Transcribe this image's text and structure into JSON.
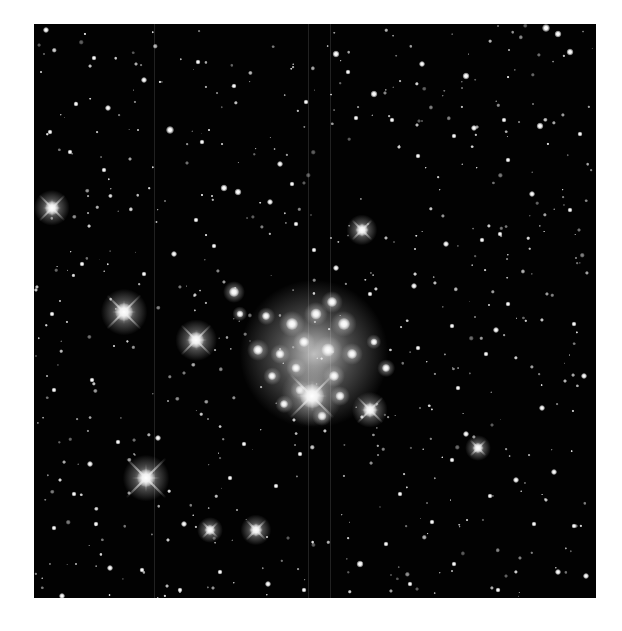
{
  "image": {
    "subject": "Star field / open star cluster",
    "frame": {
      "x": 34,
      "y": 24,
      "width": 562,
      "height": 574,
      "background": "#020202"
    },
    "page_background": "#ffffff"
  },
  "column_artifacts_x": [
    120,
    274,
    296
  ],
  "bright_stars": [
    {
      "x": 18,
      "y": 184,
      "size": 14,
      "spikes": 26
    },
    {
      "x": 90,
      "y": 288,
      "size": 18,
      "spikes": 34
    },
    {
      "x": 162,
      "y": 316,
      "size": 16,
      "spikes": 30
    },
    {
      "x": 112,
      "y": 454,
      "size": 18,
      "spikes": 40
    },
    {
      "x": 278,
      "y": 372,
      "size": 24,
      "spikes": 44
    },
    {
      "x": 336,
      "y": 386,
      "size": 14,
      "spikes": 26
    },
    {
      "x": 328,
      "y": 206,
      "size": 12,
      "spikes": 20
    },
    {
      "x": 222,
      "y": 506,
      "size": 12,
      "spikes": 20
    },
    {
      "x": 176,
      "y": 506,
      "size": 10,
      "spikes": 16
    },
    {
      "x": 444,
      "y": 424,
      "size": 10,
      "spikes": 16
    }
  ],
  "cluster_stars": [
    {
      "x": 258,
      "y": 300,
      "s": 12
    },
    {
      "x": 282,
      "y": 290,
      "s": 11
    },
    {
      "x": 298,
      "y": 278,
      "s": 10
    },
    {
      "x": 310,
      "y": 300,
      "s": 12
    },
    {
      "x": 270,
      "y": 318,
      "s": 10
    },
    {
      "x": 294,
      "y": 326,
      "s": 13
    },
    {
      "x": 246,
      "y": 330,
      "s": 9
    },
    {
      "x": 318,
      "y": 330,
      "s": 10
    },
    {
      "x": 224,
      "y": 326,
      "s": 10
    },
    {
      "x": 262,
      "y": 344,
      "s": 9
    },
    {
      "x": 300,
      "y": 352,
      "s": 10
    },
    {
      "x": 266,
      "y": 366,
      "s": 9
    },
    {
      "x": 238,
      "y": 352,
      "s": 8
    },
    {
      "x": 306,
      "y": 372,
      "s": 9
    },
    {
      "x": 250,
      "y": 380,
      "s": 8
    },
    {
      "x": 232,
      "y": 292,
      "s": 8
    },
    {
      "x": 200,
      "y": 268,
      "s": 10
    },
    {
      "x": 206,
      "y": 290,
      "s": 7
    },
    {
      "x": 340,
      "y": 318,
      "s": 7
    },
    {
      "x": 352,
      "y": 344,
      "s": 8
    },
    {
      "x": 288,
      "y": 392,
      "s": 9
    }
  ],
  "medium_stars": [
    {
      "x": 12,
      "y": 6,
      "s": 6
    },
    {
      "x": 110,
      "y": 56,
      "s": 6
    },
    {
      "x": 136,
      "y": 106,
      "s": 8
    },
    {
      "x": 42,
      "y": 80,
      "s": 5
    },
    {
      "x": 190,
      "y": 164,
      "s": 7
    },
    {
      "x": 164,
      "y": 38,
      "s": 5
    },
    {
      "x": 200,
      "y": 62,
      "s": 5
    },
    {
      "x": 168,
      "y": 118,
      "s": 5
    },
    {
      "x": 60,
      "y": 34,
      "s": 5
    },
    {
      "x": 204,
      "y": 168,
      "s": 7
    },
    {
      "x": 236,
      "y": 178,
      "s": 6
    },
    {
      "x": 16,
      "y": 108,
      "s": 5
    },
    {
      "x": 74,
      "y": 84,
      "s": 6
    },
    {
      "x": 258,
      "y": 160,
      "s": 5
    },
    {
      "x": 246,
      "y": 140,
      "s": 6
    },
    {
      "x": 302,
      "y": 30,
      "s": 7
    },
    {
      "x": 388,
      "y": 40,
      "s": 6
    },
    {
      "x": 432,
      "y": 52,
      "s": 7
    },
    {
      "x": 512,
      "y": 4,
      "s": 8
    },
    {
      "x": 524,
      "y": 10,
      "s": 7
    },
    {
      "x": 536,
      "y": 28,
      "s": 7
    },
    {
      "x": 506,
      "y": 102,
      "s": 7
    },
    {
      "x": 546,
      "y": 110,
      "s": 5
    },
    {
      "x": 470,
      "y": 96,
      "s": 5
    },
    {
      "x": 340,
      "y": 70,
      "s": 7
    },
    {
      "x": 314,
      "y": 48,
      "s": 5
    },
    {
      "x": 272,
      "y": 78,
      "s": 5
    },
    {
      "x": 322,
      "y": 94,
      "s": 5
    },
    {
      "x": 420,
      "y": 112,
      "s": 5
    },
    {
      "x": 440,
      "y": 104,
      "s": 6
    },
    {
      "x": 498,
      "y": 170,
      "s": 6
    },
    {
      "x": 384,
      "y": 132,
      "s": 5
    },
    {
      "x": 358,
      "y": 96,
      "s": 5
    },
    {
      "x": 474,
      "y": 136,
      "s": 5
    },
    {
      "x": 536,
      "y": 186,
      "s": 5
    },
    {
      "x": 412,
      "y": 220,
      "s": 6
    },
    {
      "x": 448,
      "y": 216,
      "s": 5
    },
    {
      "x": 466,
      "y": 210,
      "s": 5
    },
    {
      "x": 380,
      "y": 262,
      "s": 6
    },
    {
      "x": 418,
      "y": 302,
      "s": 5
    },
    {
      "x": 462,
      "y": 306,
      "s": 6
    },
    {
      "x": 474,
      "y": 280,
      "s": 5
    },
    {
      "x": 540,
      "y": 300,
      "s": 5
    },
    {
      "x": 550,
      "y": 352,
      "s": 6
    },
    {
      "x": 424,
      "y": 364,
      "s": 5
    },
    {
      "x": 452,
      "y": 330,
      "s": 5
    },
    {
      "x": 384,
      "y": 324,
      "s": 5
    },
    {
      "x": 508,
      "y": 384,
      "s": 6
    },
    {
      "x": 520,
      "y": 448,
      "s": 6
    },
    {
      "x": 482,
      "y": 456,
      "s": 6
    },
    {
      "x": 456,
      "y": 472,
      "s": 5
    },
    {
      "x": 432,
      "y": 410,
      "s": 6
    },
    {
      "x": 418,
      "y": 436,
      "s": 5
    },
    {
      "x": 540,
      "y": 502,
      "s": 5
    },
    {
      "x": 552,
      "y": 552,
      "s": 6
    },
    {
      "x": 524,
      "y": 548,
      "s": 6
    },
    {
      "x": 500,
      "y": 500,
      "s": 5
    },
    {
      "x": 398,
      "y": 498,
      "s": 5
    },
    {
      "x": 366,
      "y": 470,
      "s": 5
    },
    {
      "x": 352,
      "y": 520,
      "s": 5
    },
    {
      "x": 326,
      "y": 540,
      "s": 7
    },
    {
      "x": 376,
      "y": 560,
      "s": 5
    },
    {
      "x": 420,
      "y": 540,
      "s": 5
    },
    {
      "x": 464,
      "y": 566,
      "s": 5
    },
    {
      "x": 270,
      "y": 566,
      "s": 5
    },
    {
      "x": 234,
      "y": 560,
      "s": 6
    },
    {
      "x": 186,
      "y": 548,
      "s": 5
    },
    {
      "x": 146,
      "y": 566,
      "s": 5
    },
    {
      "x": 108,
      "y": 546,
      "s": 5
    },
    {
      "x": 28,
      "y": 572,
      "s": 6
    },
    {
      "x": 76,
      "y": 544,
      "s": 6
    },
    {
      "x": 20,
      "y": 504,
      "s": 5
    },
    {
      "x": 56,
      "y": 440,
      "s": 6
    },
    {
      "x": 40,
      "y": 470,
      "s": 5
    },
    {
      "x": 62,
      "y": 500,
      "s": 5
    },
    {
      "x": 124,
      "y": 414,
      "s": 6
    },
    {
      "x": 84,
      "y": 418,
      "s": 5
    },
    {
      "x": 150,
      "y": 500,
      "s": 6
    },
    {
      "x": 196,
      "y": 454,
      "s": 5
    },
    {
      "x": 210,
      "y": 420,
      "s": 5
    },
    {
      "x": 242,
      "y": 462,
      "s": 5
    },
    {
      "x": 266,
      "y": 430,
      "s": 5
    },
    {
      "x": 20,
      "y": 366,
      "s": 5
    },
    {
      "x": 18,
      "y": 290,
      "s": 5
    },
    {
      "x": 58,
      "y": 356,
      "s": 5
    },
    {
      "x": 48,
      "y": 240,
      "s": 5
    },
    {
      "x": 110,
      "y": 250,
      "s": 5
    },
    {
      "x": 140,
      "y": 230,
      "s": 6
    },
    {
      "x": 162,
      "y": 196,
      "s": 5
    },
    {
      "x": 180,
      "y": 222,
      "s": 5
    },
    {
      "x": 280,
      "y": 226,
      "s": 5
    },
    {
      "x": 262,
      "y": 200,
      "s": 5
    },
    {
      "x": 302,
      "y": 244,
      "s": 6
    },
    {
      "x": 336,
      "y": 270,
      "s": 5
    },
    {
      "x": 70,
      "y": 146,
      "s": 5
    },
    {
      "x": 36,
      "y": 128,
      "s": 5
    }
  ],
  "faint_star_seed": 73
}
